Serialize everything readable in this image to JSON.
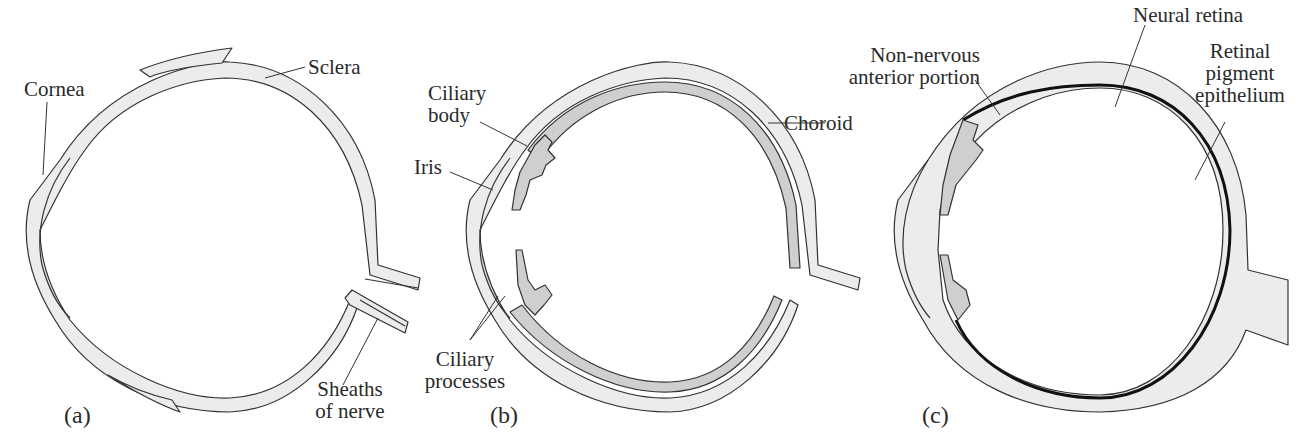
{
  "figure": {
    "colors": {
      "tissue_light": "#ececec",
      "tissue_dark": "#cfcfcf",
      "outline": "#333333",
      "retina": "#111111"
    },
    "panels": [
      {
        "id": "a",
        "label": "(a)",
        "annotations": [
          "Cornea",
          "Sclera",
          "Sheaths of nerve"
        ]
      },
      {
        "id": "b",
        "label": "(b)",
        "annotations": [
          "Ciliary body",
          "Iris",
          "Choroid",
          "Ciliary processes"
        ]
      },
      {
        "id": "c",
        "label": "(c)",
        "annotations": [
          "Non-nervous anterior portion",
          "Neural retina",
          "Retinal pigment epithelium"
        ]
      }
    ]
  },
  "labels": {
    "cornea": "Cornea",
    "sclera": "Sclera",
    "sheaths_1": "Sheaths",
    "sheaths_2": "of nerve",
    "panel_a": "(a)",
    "ciliary_body_1": "Ciliary",
    "ciliary_body_2": "body",
    "iris": "Iris",
    "choroid": "Choroid",
    "ciliary_proc_1": "Ciliary",
    "ciliary_proc_2": "processes",
    "panel_b": "(b)",
    "nonnervous_1": "Non-nervous",
    "nonnervous_2": "anterior portion",
    "neural_retina": "Neural retina",
    "rpe_1": "Retinal",
    "rpe_2": "pigment",
    "rpe_3": "epithelium",
    "panel_c": "(c)"
  }
}
